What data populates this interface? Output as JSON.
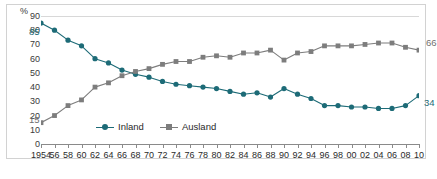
{
  "chart_data": {
    "type": "line",
    "title": "",
    "xlabel": "",
    "ylabel": "%",
    "unit_label": "%",
    "ylim": [
      0,
      90
    ],
    "y_ticks": [
      0,
      10,
      20,
      30,
      40,
      50,
      60,
      70,
      80,
      90
    ],
    "grid": false,
    "legend_position": "inside-bottom-left",
    "x": [
      1954,
      1956,
      1958,
      1960,
      1962,
      1964,
      1966,
      1968,
      1970,
      1972,
      1974,
      1976,
      1978,
      1980,
      1982,
      1984,
      1986,
      1988,
      1990,
      1992,
      1994,
      1996,
      1998,
      2000,
      2002,
      2004,
      2006,
      2008,
      2010
    ],
    "tick_labels": [
      "1954",
      "56",
      "58",
      "60",
      "62",
      "64",
      "66",
      "68",
      "70",
      "72",
      "74",
      "76",
      "78",
      "80",
      "82",
      "84",
      "86",
      "88",
      "90",
      "92",
      "94",
      "96",
      "98",
      "00",
      "02",
      "04",
      "06",
      "08",
      "10"
    ],
    "series": [
      {
        "name": "Inland",
        "color": "#1d6b77",
        "marker": "circle",
        "values": [
          85,
          80,
          73,
          69,
          60,
          57,
          52,
          49,
          47,
          44,
          42,
          41,
          40,
          39,
          37,
          35,
          36,
          33,
          39,
          35,
          32,
          27,
          27,
          26,
          26,
          25,
          25,
          27,
          34
        ]
      },
      {
        "name": "Ausland",
        "color": "#7d7d7d",
        "marker": "square",
        "values": [
          15,
          20,
          27,
          31,
          40,
          43,
          48,
          51,
          53,
          56,
          58,
          58,
          61,
          62,
          61,
          64,
          64,
          66,
          59,
          64,
          65,
          69,
          69,
          69,
          70,
          71,
          71,
          68,
          66
        ]
      }
    ],
    "annotations": [
      {
        "text": "85",
        "series": "Inland",
        "x": 1954,
        "value": 85
      },
      {
        "text": "15",
        "series": "Ausland",
        "x": 1954,
        "value": 15
      },
      {
        "text": "66",
        "series": "Ausland",
        "x": 2010,
        "value": 66
      },
      {
        "text": "34",
        "series": "Inland",
        "x": 2010,
        "value": 34
      }
    ]
  },
  "legend": {
    "items": [
      {
        "label": "Inland",
        "color": "#1d6b77",
        "marker": "circle"
      },
      {
        "label": "Ausland",
        "color": "#7d7d7d",
        "marker": "square"
      }
    ]
  },
  "caption": {
    "text": ""
  }
}
